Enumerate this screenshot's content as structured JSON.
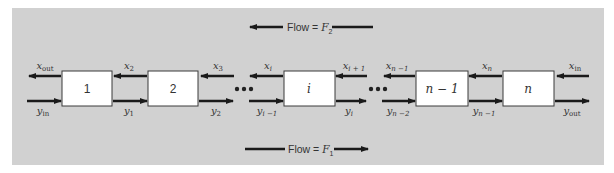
{
  "diagram": {
    "background_color": "#d1d1d1",
    "top_flow": {
      "label": "Flow = ",
      "var": "F",
      "sub": "2",
      "direction": "left"
    },
    "bottom_flow": {
      "label": "Flow = ",
      "var": "F",
      "sub": "1",
      "direction": "right"
    },
    "stages": [
      {
        "label": "1"
      },
      {
        "label": "2"
      },
      {
        "label": "i"
      },
      {
        "label": "n − 1"
      },
      {
        "label": "n"
      }
    ],
    "x_streams": [
      {
        "var": "x",
        "sub": "out"
      },
      {
        "var": "x",
        "sub": "2"
      },
      {
        "var": "x",
        "sub": "3"
      },
      {
        "var": "x",
        "sub": "i"
      },
      {
        "var": "x",
        "sub": "i + 1"
      },
      {
        "var": "x",
        "sub": "n −1"
      },
      {
        "var": "x",
        "sub": "n"
      },
      {
        "var": "x",
        "sub": "in"
      }
    ],
    "y_streams": [
      {
        "var": "y",
        "sub": "in"
      },
      {
        "var": "y",
        "sub": "1"
      },
      {
        "var": "y",
        "sub": "2"
      },
      {
        "var": "y",
        "sub": "i −1"
      },
      {
        "var": "y",
        "sub": "i"
      },
      {
        "var": "y",
        "sub": "n −2"
      },
      {
        "var": "y",
        "sub": "n −1"
      },
      {
        "var": "y",
        "sub": "out"
      }
    ],
    "ellipsis": "•••"
  }
}
